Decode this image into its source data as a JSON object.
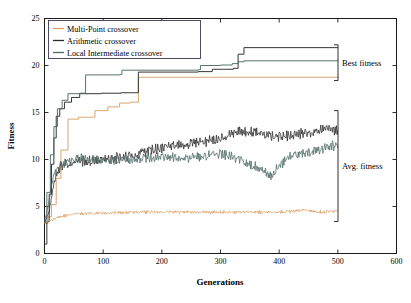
{
  "chart_data": {
    "type": "line",
    "title": "",
    "xlabel": "Generations",
    "ylabel": "Fitness",
    "xlim": [
      0,
      600
    ],
    "ylim": [
      0,
      25
    ],
    "xticks": [
      0,
      100,
      200,
      300,
      400,
      500,
      600
    ],
    "yticks": [
      0,
      5,
      10,
      15,
      20,
      25
    ],
    "grid": false,
    "legend_position": "upper left",
    "legend": [
      {
        "label": "Multi-Point crossover",
        "color": "#d9a066"
      },
      {
        "label": "Arithmetic crossover",
        "color": "#2b2b2b"
      },
      {
        "label": "Local Intermediate crossover",
        "color": "#4e6b66"
      }
    ],
    "annotations": [
      {
        "text": "Best fitness",
        "y_range": [
          18.4,
          22.2
        ]
      },
      {
        "text": "Avg. fitness",
        "y_range": [
          3.4,
          15.2
        ]
      }
    ],
    "series": [
      {
        "name": "Multi-Point crossover - Best fitness",
        "group": "best",
        "color": "#d9a066",
        "type": "step",
        "x": [
          0,
          6,
          12,
          20,
          28,
          40,
          58,
          86,
          108,
          128,
          146,
          160,
          162,
          500
        ],
        "y": [
          3.2,
          3.9,
          5.2,
          8.0,
          11.0,
          14.3,
          14.5,
          15.2,
          15.6,
          16.0,
          16.1,
          18.7,
          18.75,
          18.8
        ]
      },
      {
        "name": "Arithmetic crossover - Best fitness",
        "group": "best",
        "color": "#2b2b2b",
        "type": "step",
        "x": [
          0,
          4,
          8,
          12,
          16,
          20,
          26,
          34,
          46,
          60,
          96,
          130,
          150,
          160,
          262,
          286,
          322,
          330,
          340,
          500
        ],
        "y": [
          1.0,
          3.4,
          6.3,
          9.5,
          12.3,
          14.6,
          15.4,
          16.1,
          16.6,
          17.0,
          17.05,
          17.1,
          17.1,
          19.3,
          19.35,
          19.6,
          19.7,
          21.2,
          21.9,
          21.9
        ]
      },
      {
        "name": "Local Intermediate crossover - Best fitness",
        "group": "best",
        "color": "#4e6b66",
        "type": "step",
        "x": [
          0,
          4,
          10,
          16,
          22,
          30,
          40,
          60,
          70,
          128,
          132,
          262,
          266,
          300,
          320,
          330,
          340,
          500
        ],
        "y": [
          3.3,
          6.5,
          10.5,
          13.5,
          15.4,
          16.3,
          17.0,
          17.05,
          19.0,
          19.05,
          19.5,
          19.55,
          20.0,
          20.05,
          20.2,
          20.4,
          20.5,
          20.5
        ]
      },
      {
        "name": "Multi-Point crossover - Avg. fitness",
        "group": "avg",
        "color": "#d9a066",
        "type": "noisy",
        "baseline": [
          {
            "x": 0,
            "y": 3.3
          },
          {
            "x": 10,
            "y": 3.5
          },
          {
            "x": 25,
            "y": 3.9
          },
          {
            "x": 50,
            "y": 4.2
          },
          {
            "x": 100,
            "y": 4.3
          },
          {
            "x": 150,
            "y": 4.4
          },
          {
            "x": 200,
            "y": 4.4
          },
          {
            "x": 250,
            "y": 4.4
          },
          {
            "x": 300,
            "y": 4.4
          },
          {
            "x": 350,
            "y": 4.4
          },
          {
            "x": 400,
            "y": 4.4
          },
          {
            "x": 440,
            "y": 4.6
          },
          {
            "x": 470,
            "y": 4.4
          },
          {
            "x": 500,
            "y": 4.5
          }
        ],
        "noise_amplitude": 0.28,
        "seed": 11
      },
      {
        "name": "Arithmetic crossover - Avg. fitness",
        "group": "avg",
        "color": "#2b2b2b",
        "type": "noisy",
        "baseline": [
          {
            "x": 0,
            "y": 3.2
          },
          {
            "x": 8,
            "y": 4.5
          },
          {
            "x": 16,
            "y": 7.5
          },
          {
            "x": 26,
            "y": 9.2
          },
          {
            "x": 40,
            "y": 9.6
          },
          {
            "x": 60,
            "y": 9.8
          },
          {
            "x": 90,
            "y": 9.9
          },
          {
            "x": 120,
            "y": 10.1
          },
          {
            "x": 150,
            "y": 10.4
          },
          {
            "x": 180,
            "y": 11.0
          },
          {
            "x": 210,
            "y": 11.4
          },
          {
            "x": 240,
            "y": 11.6
          },
          {
            "x": 270,
            "y": 11.9
          },
          {
            "x": 300,
            "y": 12.2
          },
          {
            "x": 330,
            "y": 13.1
          },
          {
            "x": 360,
            "y": 12.9
          },
          {
            "x": 390,
            "y": 12.4
          },
          {
            "x": 420,
            "y": 12.6
          },
          {
            "x": 450,
            "y": 12.8
          },
          {
            "x": 480,
            "y": 13.3
          },
          {
            "x": 500,
            "y": 13.1
          }
        ],
        "noise_amplitude": 0.95,
        "seed": 23
      },
      {
        "name": "Local Intermediate crossover - Avg. fitness",
        "group": "avg",
        "color": "#4e6b66",
        "type": "noisy",
        "baseline": [
          {
            "x": 0,
            "y": 3.4
          },
          {
            "x": 6,
            "y": 5.0
          },
          {
            "x": 14,
            "y": 8.0
          },
          {
            "x": 24,
            "y": 9.3
          },
          {
            "x": 40,
            "y": 9.7
          },
          {
            "x": 60,
            "y": 10.2
          },
          {
            "x": 90,
            "y": 9.9
          },
          {
            "x": 120,
            "y": 9.9
          },
          {
            "x": 150,
            "y": 10.0
          },
          {
            "x": 180,
            "y": 10.2
          },
          {
            "x": 210,
            "y": 10.3
          },
          {
            "x": 240,
            "y": 10.1
          },
          {
            "x": 270,
            "y": 10.4
          },
          {
            "x": 300,
            "y": 10.6
          },
          {
            "x": 330,
            "y": 10.1
          },
          {
            "x": 350,
            "y": 9.5
          },
          {
            "x": 370,
            "y": 9.0
          },
          {
            "x": 385,
            "y": 8.2
          },
          {
            "x": 400,
            "y": 9.3
          },
          {
            "x": 420,
            "y": 10.4
          },
          {
            "x": 450,
            "y": 10.8
          },
          {
            "x": 475,
            "y": 11.2
          },
          {
            "x": 500,
            "y": 11.6
          }
        ],
        "noise_amplitude": 0.85,
        "seed": 37
      }
    ]
  },
  "axis": {
    "xlabel": "Generations",
    "ylabel": "Fitness",
    "xticks": [
      "0",
      "100",
      "200",
      "300",
      "400",
      "500",
      "600"
    ],
    "yticks": [
      "0",
      "5",
      "10",
      "15",
      "20",
      "25"
    ]
  },
  "legend": {
    "items": [
      {
        "label": "Multi-Point crossover"
      },
      {
        "label": "Arithmetic crossover"
      },
      {
        "label": "Local Intermediate crossover"
      }
    ]
  },
  "annotations": {
    "best": "Best fitness",
    "avg": "Avg. fitness"
  },
  "colors": {
    "multipoint": "#d9a066",
    "arithmetic": "#2b2b2b",
    "local_intermediate": "#4e6b66",
    "axis": "#1a1a1a",
    "background": "#ffffff"
  }
}
